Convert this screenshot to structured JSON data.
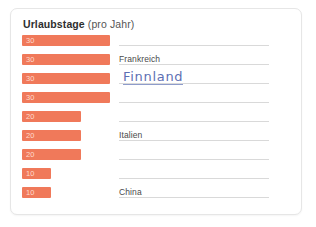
{
  "card": {
    "title_strong": "Urlaubstage",
    "title_light": " (pro Jahr)",
    "accent_color": "#f0795a",
    "handwriting_color": "#5d6fb3",
    "rule_color": "#d9d9d9"
  },
  "chart_data": {
    "type": "bar",
    "title": "Urlaubstage (pro Jahr)",
    "xlabel": "",
    "ylabel": "",
    "orientation": "horizontal",
    "xlim": [
      0,
      30
    ],
    "grid": false,
    "legend": null,
    "categories": [
      "",
      "Frankreich",
      "Finnland",
      "",
      "",
      "Italien",
      "",
      "",
      "China"
    ],
    "values": [
      30,
      30,
      30,
      30,
      20,
      20,
      20,
      10,
      10
    ],
    "value_labels": [
      "30",
      "30",
      "30",
      "30",
      "20",
      "20",
      "20",
      "10",
      "10"
    ],
    "rows": [
      {
        "value": 30,
        "value_label": "30",
        "label": "",
        "handwritten": false
      },
      {
        "value": 30,
        "value_label": "30",
        "label": "Frankreich",
        "handwritten": false
      },
      {
        "value": 30,
        "value_label": "30",
        "label": "Finnland",
        "handwritten": true
      },
      {
        "value": 30,
        "value_label": "30",
        "label": "",
        "handwritten": false
      },
      {
        "value": 20,
        "value_label": "20",
        "label": "",
        "handwritten": false
      },
      {
        "value": 20,
        "value_label": "20",
        "label": "Italien",
        "handwritten": false
      },
      {
        "value": 20,
        "value_label": "20",
        "label": "",
        "handwritten": false
      },
      {
        "value": 10,
        "value_label": "10",
        "label": "",
        "handwritten": false
      },
      {
        "value": 10,
        "value_label": "10",
        "label": "China",
        "handwritten": false
      }
    ]
  }
}
